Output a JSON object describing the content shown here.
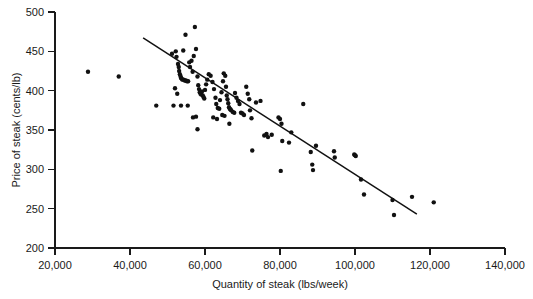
{
  "chart_data": {
    "type": "scatter",
    "title": "",
    "xlabel": "Quantity of steak (lbs/week)",
    "ylabel": "Price of steak (cents/lb)",
    "xlim": [
      20000,
      140000
    ],
    "ylim": [
      200,
      500
    ],
    "xticks": [
      20000,
      40000,
      60000,
      80000,
      100000,
      120000,
      140000
    ],
    "yticks": [
      200,
      250,
      300,
      350,
      400,
      450,
      500
    ],
    "xtick_labels": [
      "20,000",
      "40,000",
      "60,000",
      "80,000",
      "100,000",
      "120,000",
      "140,000"
    ],
    "ytick_labels": [
      "200",
      "250",
      "300",
      "350",
      "400",
      "450",
      "500"
    ],
    "grid": false,
    "legend": null,
    "series": [
      {
        "name": "Steak price vs quantity observations",
        "marker": "filled-circle",
        "color": "#111111",
        "points": [
          [
            28800,
            424
          ],
          [
            37000,
            418
          ],
          [
            47000,
            381
          ],
          [
            51200,
            447
          ],
          [
            52200,
            450
          ],
          [
            52400,
            443
          ],
          [
            52800,
            434
          ],
          [
            53000,
            430
          ],
          [
            53100,
            425
          ],
          [
            53300,
            421
          ],
          [
            53500,
            418
          ],
          [
            53600,
            416
          ],
          [
            53800,
            415
          ],
          [
            54000,
            414
          ],
          [
            54300,
            414
          ],
          [
            54600,
            413
          ],
          [
            54900,
            413
          ],
          [
            55200,
            412
          ],
          [
            55500,
            412
          ],
          [
            52000,
            403
          ],
          [
            52600,
            396
          ],
          [
            51600,
            381
          ],
          [
            53600,
            381
          ],
          [
            55400,
            381
          ],
          [
            54800,
            471
          ],
          [
            54200,
            451
          ],
          [
            55800,
            436
          ],
          [
            56000,
            430
          ],
          [
            56400,
            438
          ],
          [
            56700,
            424
          ],
          [
            57000,
            444
          ],
          [
            57300,
            481
          ],
          [
            57600,
            453
          ],
          [
            58000,
            418
          ],
          [
            58200,
            407
          ],
          [
            58400,
            402
          ],
          [
            58600,
            398
          ],
          [
            58800,
            396
          ],
          [
            59000,
            395
          ],
          [
            59200,
            399
          ],
          [
            59400,
            394
          ],
          [
            59600,
            392
          ],
          [
            59800,
            390
          ],
          [
            60000,
            401
          ],
          [
            60300,
            408
          ],
          [
            60600,
            414
          ],
          [
            56800,
            366
          ],
          [
            57600,
            367
          ],
          [
            58000,
            351
          ],
          [
            61000,
            421
          ],
          [
            61500,
            419
          ],
          [
            62000,
            411
          ],
          [
            62400,
            402
          ],
          [
            62800,
            391
          ],
          [
            63000,
            383
          ],
          [
            63400,
            378
          ],
          [
            63800,
            377
          ],
          [
            64000,
            388
          ],
          [
            64400,
            398
          ],
          [
            64800,
            412
          ],
          [
            65000,
            422
          ],
          [
            65400,
            419
          ],
          [
            65600,
            405
          ],
          [
            65800,
            394
          ],
          [
            66000,
            389
          ],
          [
            66200,
            384
          ],
          [
            66400,
            379
          ],
          [
            66600,
            377
          ],
          [
            66800,
            376
          ],
          [
            67000,
            375
          ],
          [
            67400,
            373
          ],
          [
            67800,
            372
          ],
          [
            62200,
            366
          ],
          [
            63200,
            364
          ],
          [
            64600,
            369
          ],
          [
            65200,
            368
          ],
          [
            66500,
            358
          ],
          [
            68000,
            397
          ],
          [
            68400,
            391
          ],
          [
            68800,
            387
          ],
          [
            69200,
            383
          ],
          [
            69600,
            372
          ],
          [
            70000,
            371
          ],
          [
            70400,
            369
          ],
          [
            71000,
            405
          ],
          [
            71400,
            396
          ],
          [
            71800,
            389
          ],
          [
            72000,
            375
          ],
          [
            72400,
            365
          ],
          [
            72600,
            324
          ],
          [
            73600,
            385
          ],
          [
            74800,
            387
          ],
          [
            75800,
            343
          ],
          [
            76400,
            345
          ],
          [
            76800,
            341
          ],
          [
            77800,
            344
          ],
          [
            79600,
            366
          ],
          [
            80000,
            364
          ],
          [
            80400,
            358
          ],
          [
            80600,
            336
          ],
          [
            80200,
            298
          ],
          [
            82400,
            334
          ],
          [
            83000,
            347
          ],
          [
            86200,
            383
          ],
          [
            88200,
            322
          ],
          [
            88600,
            306
          ],
          [
            88800,
            299
          ],
          [
            89600,
            330
          ],
          [
            94400,
            323
          ],
          [
            94600,
            315
          ],
          [
            99800,
            319
          ],
          [
            100000,
            318
          ],
          [
            100200,
            317
          ],
          [
            101600,
            287
          ],
          [
            102400,
            268
          ],
          [
            110000,
            261
          ],
          [
            110400,
            242
          ],
          [
            115200,
            265
          ],
          [
            121000,
            258
          ]
        ]
      }
    ],
    "fit_line": {
      "name": "Linear regression line",
      "x_start": 43500,
      "y_start": 467,
      "x_end": 116500,
      "y_end": 243
    }
  }
}
